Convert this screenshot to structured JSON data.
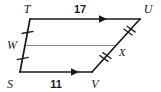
{
  "figure": {
    "type": "geometry-diagram",
    "shape": "quadrilateral-with-midsegment",
    "stroke_color": "#1a1a1a",
    "midsegment_color": "#8c8c8c",
    "background": "#ffffff",
    "vertices": [
      {
        "name": "T",
        "label": "T",
        "x": 30,
        "y": 19,
        "label_x": 27,
        "label_y": 13
      },
      {
        "name": "U",
        "label": "U",
        "x": 140,
        "y": 19,
        "label_x": 146,
        "label_y": 13
      },
      {
        "name": "V",
        "label": "V",
        "x": 92,
        "y": 72,
        "label_x": 93,
        "label_y": 86
      },
      {
        "name": "S",
        "label": "S",
        "x": 20,
        "y": 72,
        "label_x": 9,
        "label_y": 86
      }
    ],
    "midpoints": [
      {
        "name": "W",
        "label": "W",
        "x": 25,
        "y": 45.5,
        "label_x": 11,
        "label_y": 49,
        "ticks": 1,
        "on_segment": "TS"
      },
      {
        "name": "X",
        "label": "X",
        "x": 116,
        "y": 45.5,
        "label_x": 120,
        "label_y": 55,
        "ticks": 2,
        "on_segment": "UV"
      }
    ],
    "midsegment": {
      "from": "W",
      "to": "X",
      "x1": 25,
      "y1": 45.5,
      "x2": 116,
      "y2": 45.5
    },
    "measures": [
      {
        "name": "TU",
        "value": "17",
        "x": 80,
        "y": 12
      },
      {
        "name": "SV",
        "value": "11",
        "x": 56,
        "y": 88
      },
      {
        "name": "XV",
        "value": "x",
        "x": 120,
        "y": 55
      }
    ],
    "arrows": [
      {
        "on_segment": "TU",
        "direction": "right",
        "tip_x": 107,
        "y": 19
      },
      {
        "on_segment": "SV",
        "direction": "right",
        "tip_x": 79,
        "y": 72
      }
    ],
    "tick_marks": {
      "single_on": "TS",
      "double_on": "UV",
      "single_count": 1,
      "double_count": 2
    }
  }
}
